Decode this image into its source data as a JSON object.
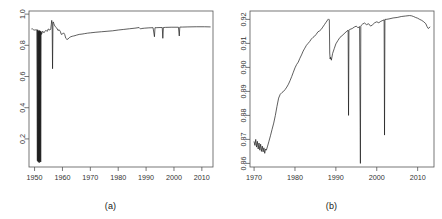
{
  "figure": {
    "background": "#ffffff",
    "line_color": "#1a1a1a",
    "axis_color": "#555555",
    "tick_label_color": "#333333"
  },
  "panels": [
    {
      "id": "a",
      "caption": "(a)",
      "frame": {
        "x": 29,
        "y": 11,
        "width": 184,
        "height": 156
      }
    },
    {
      "id": "b",
      "caption": "(b)",
      "frame": {
        "x": 29,
        "y": 11,
        "width": 184,
        "height": 156
      }
    }
  ],
  "chart_data": [
    {
      "type": "line",
      "panel": "a",
      "title": "",
      "xlabel": "",
      "ylabel": "",
      "xlim": [
        1948,
        2014
      ],
      "ylim": [
        0.02,
        1.02
      ],
      "grid": false,
      "legend": null,
      "xticks": [
        1950,
        1960,
        1970,
        1980,
        1990,
        2000,
        2010
      ],
      "xtick_labels": [
        "1950",
        "1960",
        "1970",
        "1980",
        "1990",
        "2000",
        "2010"
      ],
      "yticks": [
        0.2,
        0.4,
        0.6,
        0.8,
        1.0
      ],
      "ytick_labels": [
        "0.2",
        "0.4",
        "0.6",
        "0.8",
        "1.0"
      ],
      "series": [
        {
          "name": "series-a",
          "x": [
            1949.0,
            1949.3,
            1949.6,
            1949.9,
            1950.2,
            1950.5,
            1950.8,
            1951.0,
            1951.1,
            1951.2,
            1951.3,
            1951.4,
            1951.5,
            1951.6,
            1951.7,
            1951.8,
            1951.9,
            1952.0,
            1952.1,
            1952.2,
            1952.35,
            1952.5,
            1952.7,
            1952.9,
            1953.1,
            1953.4,
            1953.7,
            1954.0,
            1954.3,
            1954.6,
            1954.9,
            1955.2,
            1955.5,
            1955.8,
            1956.0,
            1956.15,
            1956.3,
            1956.45,
            1956.6,
            1956.75,
            1956.9,
            1957.1,
            1957.4,
            1957.7,
            1958.0,
            1958.4,
            1958.8,
            1959.2,
            1959.6,
            1960.0,
            1960.4,
            1960.8,
            1961.2,
            1961.6,
            1962.0,
            1962.5,
            1963.0,
            1963.5,
            1964.0,
            1964.5,
            1965.0,
            1966.0,
            1967.0,
            1968.0,
            1969.0,
            1970.0,
            1972.0,
            1974.0,
            1976.0,
            1978.0,
            1980.0,
            1982.0,
            1984.0,
            1986.0,
            1987.5,
            1988.0,
            1988.5,
            1989.5,
            1991.0,
            1992.5,
            1993.0,
            1993.2,
            1993.6,
            1995.0,
            1995.8,
            1996.0,
            1996.2,
            1997.0,
            1999.0,
            2001.6,
            2001.9,
            2002.1,
            2003.0,
            2005.0,
            2008.0,
            2011.0,
            2013.0
          ],
          "y": [
            0.905,
            0.905,
            0.9,
            0.898,
            0.898,
            0.9,
            0.899,
            0.06,
            0.9,
            0.055,
            0.895,
            0.05,
            0.89,
            0.06,
            0.895,
            0.048,
            0.893,
            0.055,
            0.89,
            0.052,
            0.888,
            0.87,
            0.88,
            0.89,
            0.885,
            0.88,
            0.89,
            0.895,
            0.893,
            0.89,
            0.905,
            0.9,
            0.898,
            0.905,
            0.935,
            0.96,
            0.94,
            0.65,
            0.945,
            0.95,
            0.94,
            0.93,
            0.92,
            0.915,
            0.91,
            0.895,
            0.9,
            0.89,
            0.87,
            0.872,
            0.88,
            0.87,
            0.845,
            0.838,
            0.84,
            0.85,
            0.855,
            0.858,
            0.86,
            0.862,
            0.865,
            0.87,
            0.872,
            0.875,
            0.878,
            0.88,
            0.884,
            0.887,
            0.89,
            0.893,
            0.898,
            0.902,
            0.906,
            0.91,
            0.914,
            0.905,
            0.908,
            0.91,
            0.912,
            0.913,
            0.855,
            0.913,
            0.913,
            0.914,
            0.914,
            0.845,
            0.914,
            0.915,
            0.916,
            0.916,
            0.86,
            0.917,
            0.917,
            0.918,
            0.919,
            0.919,
            0.918
          ]
        }
      ]
    },
    {
      "type": "line",
      "panel": "b",
      "title": "",
      "xlabel": "",
      "ylabel": "",
      "xlim": [
        1969.0,
        2014.0
      ],
      "ylim": [
        0.8585,
        0.9235
      ],
      "grid": false,
      "legend": null,
      "xticks": [
        1970,
        1980,
        1990,
        2000,
        2010
      ],
      "xtick_labels": [
        "1970",
        "1980",
        "1990",
        "2000",
        "2010"
      ],
      "yticks": [
        0.86,
        0.87,
        0.88,
        0.89,
        0.9,
        0.91,
        0.92
      ],
      "ytick_labels": [
        "0.86",
        "0.87",
        "0.88",
        "0.89",
        "0.90",
        "0.91",
        "0.92"
      ],
      "series": [
        {
          "name": "series-b",
          "x": [
            1970.0,
            1970.2,
            1970.4,
            1970.6,
            1970.8,
            1971.0,
            1971.2,
            1971.4,
            1971.6,
            1971.8,
            1972.0,
            1972.2,
            1972.4,
            1972.6,
            1972.8,
            1973.0,
            1973.3,
            1973.6,
            1974.0,
            1974.4,
            1974.8,
            1975.2,
            1975.6,
            1976.0,
            1976.4,
            1976.8,
            1977.2,
            1977.6,
            1978.0,
            1978.4,
            1978.8,
            1979.2,
            1979.6,
            1980.0,
            1980.4,
            1980.8,
            1981.2,
            1981.6,
            1982.0,
            1982.4,
            1982.8,
            1983.2,
            1983.6,
            1984.0,
            1984.4,
            1984.8,
            1985.2,
            1985.6,
            1986.0,
            1986.4,
            1986.8,
            1987.2,
            1987.6,
            1988.0,
            1988.2,
            1988.4,
            1988.5,
            1988.6,
            1988.7,
            1988.9,
            1989.2,
            1989.6,
            1990.0,
            1990.5,
            1991.0,
            1991.5,
            1992.0,
            1992.5,
            1993.0,
            1993.1,
            1993.2,
            1993.4,
            1994.0,
            1994.5,
            1995.0,
            1995.4,
            1995.8,
            1996.0,
            1996.1,
            1996.2,
            1996.5,
            1997.0,
            1997.5,
            1998.0,
            1998.5,
            1999.0,
            1999.5,
            2000.0,
            2000.5,
            2001.0,
            2001.5,
            2001.8,
            2001.9,
            2002.0,
            2002.3,
            2003.0,
            2004.0,
            2005.0,
            2006.0,
            2007.0,
            2008.0,
            2008.5,
            2009.0,
            2009.5,
            2010.0,
            2010.5,
            2011.0,
            2011.5,
            2012.0,
            2012.3,
            2012.6,
            2013.0
          ],
          "y": [
            0.869,
            0.8675,
            0.87,
            0.8668,
            0.8692,
            0.866,
            0.8685,
            0.8655,
            0.868,
            0.865,
            0.8672,
            0.8648,
            0.8665,
            0.8642,
            0.866,
            0.8655,
            0.8672,
            0.869,
            0.8715,
            0.8742,
            0.8768,
            0.88,
            0.8838,
            0.8872,
            0.8888,
            0.8895,
            0.89,
            0.8908,
            0.8918,
            0.893,
            0.8945,
            0.8962,
            0.898,
            0.8998,
            0.9012,
            0.9022,
            0.9038,
            0.9052,
            0.9068,
            0.908,
            0.9092,
            0.91,
            0.9108,
            0.9118,
            0.9125,
            0.913,
            0.9138,
            0.9148,
            0.9152,
            0.9158,
            0.9168,
            0.9178,
            0.9188,
            0.9198,
            0.9202,
            0.9198,
            0.906,
            0.9035,
            0.9042,
            0.903,
            0.9058,
            0.9078,
            0.9098,
            0.9112,
            0.9125,
            0.9132,
            0.914,
            0.9148,
            0.9155,
            0.88,
            0.9155,
            0.9158,
            0.9162,
            0.9168,
            0.9172,
            0.9165,
            0.917,
            0.86,
            0.9172,
            0.9175,
            0.918,
            0.9185,
            0.9178,
            0.9182,
            0.9172,
            0.9178,
            0.9186,
            0.919,
            0.9186,
            0.9192,
            0.9196,
            0.9198,
            0.8718,
            0.92,
            0.92,
            0.9202,
            0.9206,
            0.9208,
            0.9212,
            0.9214,
            0.9216,
            0.9215,
            0.9212,
            0.9208,
            0.9205,
            0.92,
            0.9196,
            0.919,
            0.9182,
            0.917,
            0.9162,
            0.9168
          ]
        }
      ]
    }
  ]
}
